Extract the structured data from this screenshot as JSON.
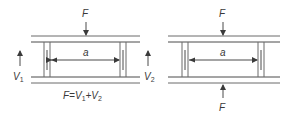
{
  "diagram": {
    "left": {
      "force_top_label": "F",
      "dimension_label": "a",
      "reaction_left_label": "V",
      "reaction_left_sub": "1",
      "reaction_right_label": "V",
      "reaction_right_sub": "2",
      "equation": {
        "lhs": "F=V",
        "sub1": "1",
        "plus": "+V",
        "sub2": "2"
      }
    },
    "right": {
      "force_top_label": "F",
      "dimension_label": "a",
      "force_bottom_label": "F"
    },
    "colors": {
      "line": "#6b6b6b",
      "text": "#3a3a3a",
      "background": "#ffffff"
    }
  }
}
